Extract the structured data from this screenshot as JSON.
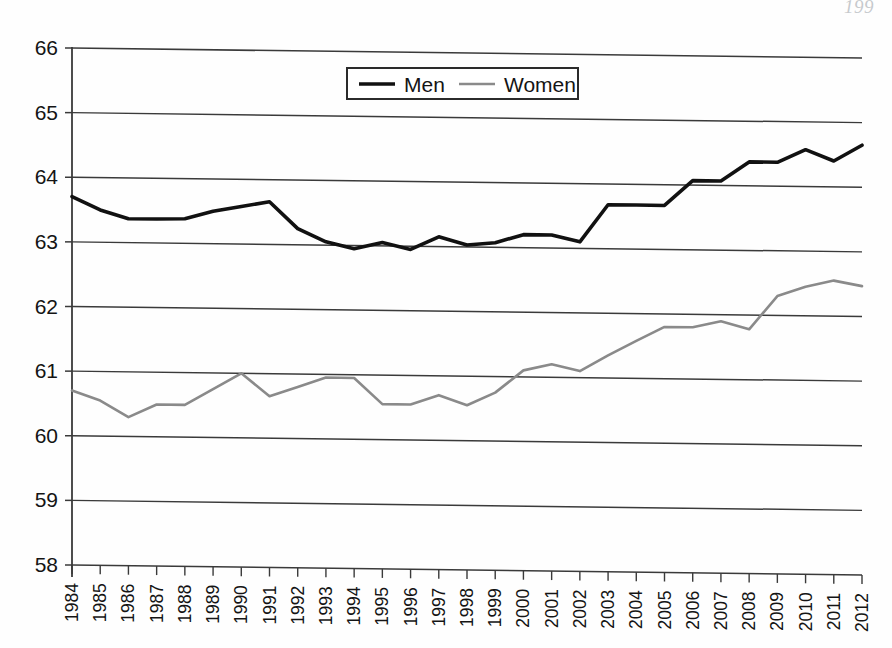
{
  "page": {
    "folio": "199",
    "running_head": ""
  },
  "legend": {
    "position": "top-center",
    "entries": [
      {
        "label": "Men",
        "color": "#111111"
      },
      {
        "label": "Women",
        "color": "#8a8a8a"
      }
    ]
  },
  "chart_data": {
    "type": "line",
    "title": "",
    "subtitle": "",
    "xlabel": "",
    "ylabel": "",
    "xlim": [
      1984,
      2012
    ],
    "ylim": [
      58,
      66
    ],
    "ytick_step": 1,
    "grid": true,
    "grid_axis": "y",
    "legend_position": "top-center",
    "categories": [
      "1984",
      "1985",
      "1986",
      "1987",
      "1988",
      "1989",
      "1990",
      "1991",
      "1992",
      "1993",
      "1994",
      "1995",
      "1996",
      "1997",
      "1998",
      "1999",
      "2000",
      "2001",
      "2002",
      "2003",
      "2004",
      "2005",
      "2006",
      "2007",
      "2008",
      "2009",
      "2010",
      "2011",
      "2012"
    ],
    "x": [
      1984,
      1985,
      1986,
      1987,
      1988,
      1989,
      1990,
      1991,
      1992,
      1993,
      1994,
      1995,
      1996,
      1997,
      1998,
      1999,
      2000,
      2001,
      2002,
      2003,
      2004,
      2005,
      2006,
      2007,
      2008,
      2009,
      2010,
      2011,
      2012
    ],
    "yticks": [
      58,
      59,
      60,
      61,
      62,
      63,
      64,
      65,
      66
    ],
    "series": [
      {
        "name": "Men",
        "color": "#111111",
        "width": 3.6,
        "values": [
          63.7,
          63.5,
          63.37,
          63.37,
          63.38,
          63.5,
          63.58,
          63.66,
          63.25,
          63.05,
          62.95,
          63.05,
          62.95,
          63.15,
          63.03,
          63.07,
          63.2,
          63.2,
          63.1,
          63.68,
          63.68,
          63.68,
          64.07,
          64.07,
          64.37,
          64.37,
          64.57,
          64.4,
          64.65
        ]
      },
      {
        "name": "Women",
        "color": "#8a8a8a",
        "width": 2.6,
        "values": [
          60.7,
          60.55,
          60.3,
          60.5,
          60.5,
          60.75,
          61.0,
          60.65,
          60.8,
          60.95,
          60.95,
          60.55,
          60.55,
          60.7,
          60.55,
          60.75,
          61.1,
          61.2,
          61.1,
          61.35,
          61.58,
          61.8,
          61.8,
          61.9,
          61.78,
          62.3,
          62.45,
          62.55,
          62.47
        ]
      }
    ]
  }
}
